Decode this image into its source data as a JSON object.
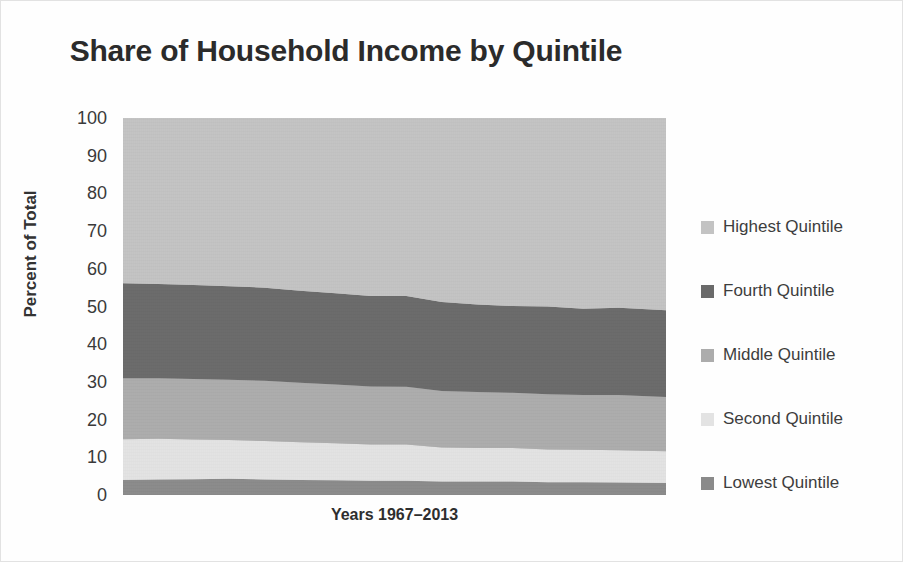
{
  "chart_data": {
    "type": "area",
    "title": "Share of Household Income by Quintile",
    "subtitle": "",
    "xlabel": "Years 1967–2013",
    "ylabel": "Percent of Total",
    "stacked": true,
    "stack_total": 100,
    "grid": false,
    "legend_position": "right",
    "ylim": [
      0,
      100
    ],
    "yticks": [
      100,
      90,
      80,
      70,
      60,
      50,
      40,
      30,
      20,
      10,
      0
    ],
    "ytick_labels": [
      "100",
      "90",
      "80",
      "70",
      "60",
      "50",
      "40",
      "30",
      "20",
      "10",
      "0"
    ],
    "xlim": [
      1967,
      2013
    ],
    "xtick_labels": [],
    "x": [
      1967,
      1970,
      1973,
      1976,
      1979,
      1982,
      1985,
      1988,
      1991,
      1994,
      1997,
      2000,
      2003,
      2006,
      2009,
      2013
    ],
    "series": [
      {
        "name": "Lowest Quintile",
        "color": "#8a8a8a",
        "stack_order": 1,
        "values": [
          4.0,
          4.1,
          4.2,
          4.3,
          4.1,
          4.0,
          3.9,
          3.8,
          3.8,
          3.6,
          3.6,
          3.6,
          3.4,
          3.4,
          3.3,
          3.2
        ]
      },
      {
        "name": "Second Quintile",
        "color": "#e3e3e3",
        "stack_order": 2,
        "values": [
          10.8,
          10.8,
          10.5,
          10.3,
          10.2,
          10.0,
          9.8,
          9.6,
          9.6,
          9.0,
          8.9,
          8.9,
          8.7,
          8.6,
          8.6,
          8.4
        ]
      },
      {
        "name": "Middle Quintile",
        "color": "#acacac",
        "stack_order": 3,
        "values": [
          16.2,
          16.1,
          16.1,
          16.0,
          16.0,
          15.8,
          15.6,
          15.4,
          15.3,
          15.0,
          14.8,
          14.6,
          14.6,
          14.5,
          14.6,
          14.4
        ]
      },
      {
        "name": "Fourth Quintile",
        "color": "#6a6a6a",
        "stack_order": 4,
        "values": [
          25.2,
          25.0,
          24.9,
          24.8,
          24.7,
          24.4,
          24.2,
          24.0,
          24.1,
          23.6,
          23.2,
          23.0,
          23.3,
          22.9,
          23.2,
          23.0
        ]
      },
      {
        "name": "Highest Quintile",
        "color": "#c3c3c3",
        "stack_order": 5,
        "values": [
          43.8,
          44.0,
          44.3,
          44.6,
          45.0,
          45.8,
          46.5,
          47.2,
          47.2,
          48.8,
          49.5,
          49.9,
          50.0,
          50.6,
          50.3,
          51.0
        ]
      }
    ],
    "cumulative_top_boundaries": {
      "note": "stacked cumulative upper edge of each band, percent of total",
      "lowest": [
        4.0,
        4.1,
        4.2,
        4.3,
        4.1,
        4.0,
        3.9,
        3.8,
        3.8,
        3.6,
        3.6,
        3.6,
        3.4,
        3.4,
        3.3,
        3.2
      ],
      "second": [
        14.8,
        14.9,
        14.7,
        14.6,
        14.3,
        14.0,
        13.7,
        13.4,
        13.4,
        12.6,
        12.5,
        12.5,
        12.1,
        12.0,
        11.9,
        11.6
      ],
      "middle": [
        31.0,
        31.0,
        30.8,
        30.6,
        30.3,
        29.8,
        29.3,
        28.8,
        28.7,
        27.6,
        27.3,
        27.1,
        26.7,
        26.5,
        26.5,
        26.0
      ],
      "fourth": [
        56.2,
        56.0,
        55.7,
        55.4,
        55.0,
        54.2,
        53.5,
        52.8,
        52.8,
        51.2,
        50.5,
        50.1,
        50.0,
        49.4,
        49.7,
        49.0
      ],
      "highest": [
        100,
        100,
        100,
        100,
        100,
        100,
        100,
        100,
        100,
        100,
        100,
        100,
        100,
        100,
        100,
        100
      ]
    }
  },
  "legend": {
    "items": [
      {
        "label": "Highest Quintile",
        "color": "#c3c3c3"
      },
      {
        "label": "Fourth Quintile",
        "color": "#6a6a6a"
      },
      {
        "label": "Middle Quintile",
        "color": "#acacac"
      },
      {
        "label": "Second Quintile",
        "color": "#e3e3e3"
      },
      {
        "label": "Lowest Quintile",
        "color": "#8a8a8a"
      }
    ]
  }
}
